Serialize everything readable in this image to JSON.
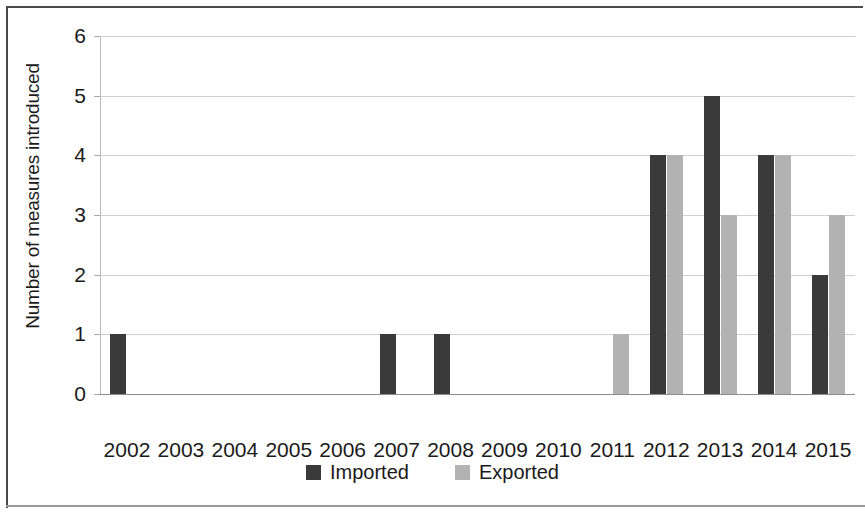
{
  "chart_data": {
    "type": "bar",
    "title": "",
    "subtitle": "",
    "xlabel": "",
    "ylabel": "Number of measures introduced",
    "categories": [
      "2002",
      "2003",
      "2004",
      "2005",
      "2006",
      "2007",
      "2008",
      "2009",
      "2010",
      "2011",
      "2012",
      "2013",
      "2014",
      "2015"
    ],
    "series": [
      {
        "name": "Imported",
        "color": "#3a3a3a",
        "values": [
          1,
          0,
          0,
          0,
          0,
          1,
          1,
          0,
          0,
          0,
          4,
          5,
          4,
          2
        ]
      },
      {
        "name": "Exported",
        "color": "#b2b2b2",
        "values": [
          0,
          0,
          0,
          0,
          0,
          0,
          0,
          0,
          0,
          1,
          4,
          3,
          4,
          3
        ]
      }
    ],
    "ylim": [
      0,
      6
    ],
    "yticks": [
      "0",
      "1",
      "2",
      "3",
      "4",
      "5",
      "6"
    ],
    "grid": true,
    "legend_position": "bottom-center"
  },
  "legend": {
    "entries": [
      {
        "label": "Imported",
        "swatch": "imported-swatch"
      },
      {
        "label": "Exported",
        "swatch": "exported-swatch"
      }
    ]
  },
  "colors": {
    "imported": "#3a3a3a",
    "exported": "#b2b2b2",
    "gridline": "#cfcfcf",
    "axis": "#8d8d8d",
    "frame": "#4a4a4a",
    "text": "#1a1a1a",
    "background": "#ffffff"
  }
}
